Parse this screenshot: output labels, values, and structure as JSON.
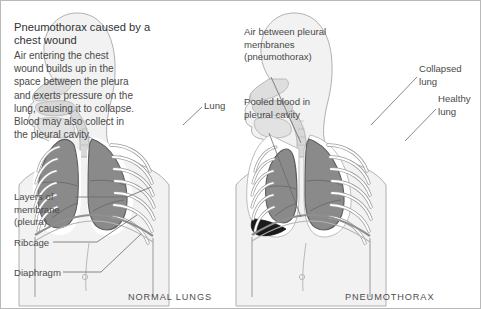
{
  "figure": {
    "title": "Pneumothorax caused by a chest wound",
    "intro": "Air entering the chest wound builds up in the space between the pleura and exerts pressure on the lung, causing it to collapse. Blood may also collect in the pleural cavity.",
    "captions": {
      "left": "NORMAL LUNGS",
      "right": "PNEUMOTHORAX"
    },
    "labels": {
      "pleura": "Layers of membrane (pleura)",
      "ribcage": "Ribcage",
      "diaphragm": "Diaphragm",
      "lung": "Lung",
      "air": "Air between pleural membranes (pneumothorax)",
      "blood": "Pooled blood in pleural cavity",
      "collapsed_lung": "Collapsed lung",
      "healthy_lung": "Healthy lung"
    },
    "colors": {
      "border": "#b9b9b9",
      "body_fill": "#f2f2f2",
      "body_outline": "#b0b0b0",
      "lung_fill": "#8a8a8a",
      "lung_outline": "#5e5e5e",
      "rib_fill": "#ffffff",
      "rib_outline": "#9a9a9a",
      "airway_fill": "#d8d8d8",
      "blood_fill": "#1a1a1a",
      "air_space": "#ffffff",
      "leader_line": "#6a6a6a",
      "title_text": "#333333",
      "body_text": "#4a4a4a",
      "caption_text": "#4f4f4f"
    }
  }
}
